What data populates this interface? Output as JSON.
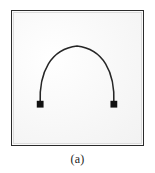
{
  "figure": {
    "caption": "(a)",
    "panel_label": "a",
    "frame": {
      "border_color": "#2b2b2b",
      "inner_rule_color": "#dcdcdc",
      "background_color": "#f9f9f9"
    },
    "curve": {
      "name": "elastica-arch-curve",
      "description": "symmetric arch (catenary-like) curve joining two fixed square supports",
      "stroke_color": "#262626",
      "stroke_width": 1.6,
      "apex_x": 77,
      "apex_y": 45,
      "left_end_x": 39,
      "left_end_y": 105,
      "right_end_x": 116,
      "right_end_y": 105,
      "path": "M 39 105 C 37.5 72 50 48 77 45 C 104 48 116.5 72 115 105"
    },
    "markers": [
      {
        "name": "left-support-marker",
        "shape": "square",
        "color": "#111111",
        "x": 39,
        "y": 105,
        "size": 7
      },
      {
        "name": "right-support-marker",
        "shape": "square",
        "color": "#111111",
        "x": 115,
        "y": 105,
        "size": 7
      }
    ]
  }
}
